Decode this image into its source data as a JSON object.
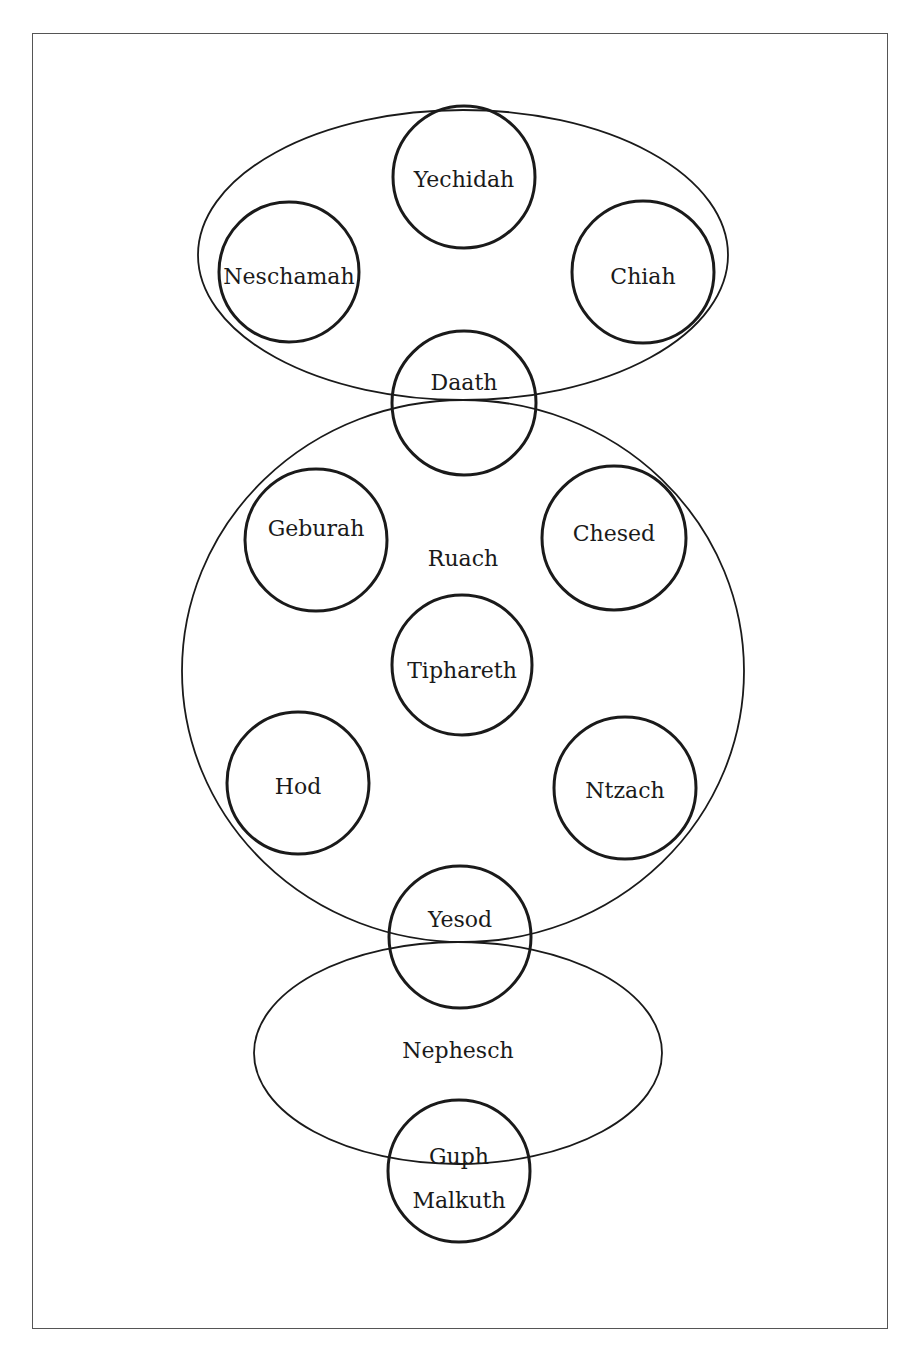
{
  "colors": {
    "stroke": "#1a1a1a",
    "frame": "#555555",
    "background": "#ffffff"
  },
  "groups": [
    {
      "id": "upper",
      "label": "",
      "shape": "ellipse",
      "cx": 463,
      "cy": 255,
      "rx": 265,
      "ry": 145
    },
    {
      "id": "ruach",
      "label": "Ruach",
      "shape": "ellipse",
      "cx": 463,
      "cy": 671,
      "rx": 281,
      "ry": 271,
      "label_x": 463,
      "label_y": 560
    },
    {
      "id": "nephesch",
      "label": "Nephesch",
      "shape": "ellipse",
      "cx": 458,
      "cy": 1053,
      "rx": 204,
      "ry": 111,
      "label_x": 458,
      "label_y": 1052
    }
  ],
  "nodes": [
    {
      "id": "yechidah",
      "label": "Yechidah",
      "cx": 464,
      "cy": 177,
      "r": 71,
      "label_y": 181
    },
    {
      "id": "neschamah",
      "label": "Neschamah",
      "cx": 289,
      "cy": 272,
      "r": 70,
      "label_y": 278
    },
    {
      "id": "chiah",
      "label": "Chiah",
      "cx": 643,
      "cy": 272,
      "r": 71,
      "label_y": 278
    },
    {
      "id": "daath",
      "label": "Daath",
      "cx": 464,
      "cy": 403,
      "r": 72,
      "label_y": 384
    },
    {
      "id": "geburah",
      "label": "Geburah",
      "cx": 316,
      "cy": 540,
      "r": 71,
      "label_y": 530
    },
    {
      "id": "chesed",
      "label": "Chesed",
      "cx": 614,
      "cy": 538,
      "r": 72,
      "label_y": 535
    },
    {
      "id": "tiphareth",
      "label": "Tiphareth",
      "cx": 462,
      "cy": 665,
      "r": 70,
      "label_y": 672
    },
    {
      "id": "hod",
      "label": "Hod",
      "cx": 298,
      "cy": 783,
      "r": 71,
      "label_y": 788
    },
    {
      "id": "ntzach",
      "label": "Ntzach",
      "cx": 625,
      "cy": 788,
      "r": 71,
      "label_y": 792
    },
    {
      "id": "yesod",
      "label": "Yesod",
      "cx": 460,
      "cy": 937,
      "r": 71,
      "label_y": 921
    },
    {
      "id": "malkuth",
      "label": "Malkuth",
      "cx": 459,
      "cy": 1171,
      "r": 71,
      "label_y": 1202,
      "sublabel": "Guph",
      "sublabel_y": 1158
    }
  ]
}
